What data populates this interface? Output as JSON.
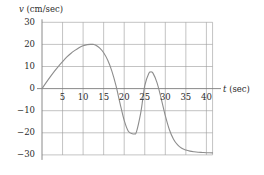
{
  "chart_data": {
    "type": "line",
    "title": "",
    "subtitle": "",
    "xlabel": "t (sec)",
    "ylabel": "v (cm/sec)",
    "xlabel_symbol": "t",
    "xlabel_unit": "(sec)",
    "ylabel_symbol": "v",
    "ylabel_unit": "(cm/sec)",
    "xlim": [
      0,
      41.5
    ],
    "ylim": [
      -30,
      30
    ],
    "xticks": [
      5,
      10,
      15,
      20,
      25,
      30,
      35,
      40
    ],
    "yticks": [
      30,
      20,
      10,
      0,
      -10,
      -20,
      -30
    ],
    "xtick_labels": [
      "5",
      "10",
      "15",
      "20",
      "25",
      "30",
      "35",
      "40"
    ],
    "ytick_labels": [
      "30",
      "20",
      "10",
      "0",
      "−10",
      "−20",
      "−30"
    ],
    "grid": true,
    "grid_color": "#9a9a9a",
    "axis_color": "#7d7d7d",
    "legend": null,
    "legend_position": "none",
    "series": [
      {
        "name": "velocity",
        "color": "#8d8d8d",
        "x": [
          0,
          1,
          2,
          3,
          4,
          5,
          6,
          7,
          8,
          9,
          10,
          11,
          12,
          12.5,
          13,
          14,
          15,
          16,
          17,
          18,
          19,
          20,
          21,
          22,
          22.5,
          23,
          24,
          24.5,
          25,
          26,
          26.5,
          27,
          28,
          29,
          30,
          31,
          32,
          33,
          34,
          35,
          36,
          37,
          38,
          39,
          40,
          41.5
        ],
        "y": [
          0,
          2.7,
          5.3,
          7.8,
          10.1,
          12.2,
          14.2,
          15.9,
          17.3,
          18.5,
          19.4,
          19.9,
          20.0,
          20.0,
          19.7,
          18.4,
          16.2,
          12.8,
          7.9,
          1.3,
          -6.8,
          -14.4,
          -19.3,
          -20.4,
          -20.5,
          -19.5,
          -11.2,
          -5.0,
          1.4,
          6.9,
          7.5,
          7.0,
          2.6,
          -4.5,
          -12.2,
          -18.6,
          -22.9,
          -25.5,
          -27.0,
          -27.8,
          -28.3,
          -28.6,
          -28.8,
          -28.9,
          -29.0,
          -29.1
        ]
      }
    ],
    "annotations": [],
    "notable_points": {
      "start": [
        0,
        0
      ],
      "first_maximum": [
        12.5,
        20
      ],
      "first_zero_crossing_down": [
        18.2,
        0
      ],
      "minimum": [
        22.5,
        -20.5
      ],
      "second_zero_crossing_up": [
        24.8,
        0
      ],
      "second_maximum": [
        26.4,
        7.5
      ],
      "third_zero_crossing_down": [
        28.6,
        0
      ],
      "asymptote": -29
    }
  }
}
